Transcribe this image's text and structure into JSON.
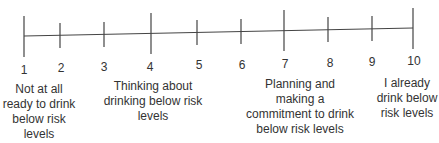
{
  "scale": {
    "ticks": [
      {
        "value": "1",
        "x": 24,
        "long": true
      },
      {
        "value": "2",
        "x": 60,
        "long": false
      },
      {
        "value": "3",
        "x": 104,
        "long": false
      },
      {
        "value": "4",
        "x": 151,
        "long": true
      },
      {
        "value": "5",
        "x": 197,
        "long": false
      },
      {
        "value": "6",
        "x": 241,
        "long": false
      },
      {
        "value": "7",
        "x": 284,
        "long": true
      },
      {
        "value": "8",
        "x": 328,
        "long": false
      },
      {
        "value": "9",
        "x": 372,
        "long": false
      },
      {
        "value": "10",
        "x": 413,
        "long": true
      }
    ],
    "line_color": "#444444"
  },
  "anchors": {
    "a1": "Not at all ready to drink below risk levels",
    "a4": "Thinking about drinking below risk levels",
    "a7": "Planning and making a commitment to drink below risk levels",
    "a10": "I already drink below risk levels"
  }
}
